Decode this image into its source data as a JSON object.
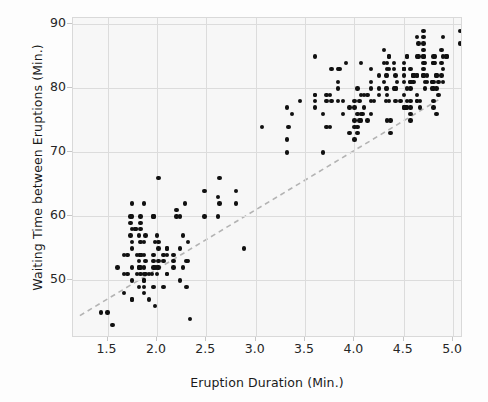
{
  "chart_data": {
    "type": "scatter",
    "title": "",
    "xlabel": "Eruption Duration (Min.)",
    "ylabel": "Waiting Time between Eruptions (Min.)",
    "xlim": [
      1.15,
      5.1
    ],
    "ylim": [
      41,
      91
    ],
    "xticks": [
      1.5,
      2.0,
      2.5,
      3.0,
      3.5,
      4.0,
      4.5,
      5.0
    ],
    "xticklabels": [
      "1.5",
      "2.0",
      "2.5",
      "3.0",
      "3.5",
      "4.0",
      "4.5",
      "5.0"
    ],
    "yticks": [
      50,
      60,
      70,
      80,
      90
    ],
    "yticklabels": [
      "50",
      "60",
      "70",
      "80",
      "90"
    ],
    "grid": true,
    "legend": "none",
    "marker_color": "#111111",
    "grid_color": "#dcdcdc",
    "plot_background": "#f7f7f7",
    "trendline": {
      "style": "dashed",
      "color": "#b3b3b3",
      "x0": 1.22,
      "y0": 44.5,
      "x1": 4.85,
      "y1": 78.2
    },
    "annotations": [],
    "points": [
      [
        3.6,
        79
      ],
      [
        1.8,
        54
      ],
      [
        3.333,
        74
      ],
      [
        2.283,
        62
      ],
      [
        4.533,
        85
      ],
      [
        2.883,
        55
      ],
      [
        4.7,
        88
      ],
      [
        3.6,
        85
      ],
      [
        1.95,
        51
      ],
      [
        4.35,
        85
      ],
      [
        1.833,
        54
      ],
      [
        3.917,
        84
      ],
      [
        4.2,
        78
      ],
      [
        1.75,
        47
      ],
      [
        4.7,
        83
      ],
      [
        2.167,
        52
      ],
      [
        1.75,
        62
      ],
      [
        4.8,
        84
      ],
      [
        1.6,
        52
      ],
      [
        4.25,
        79
      ],
      [
        1.8,
        51
      ],
      [
        1.75,
        47
      ],
      [
        3.45,
        78
      ],
      [
        3.067,
        74
      ],
      [
        4.533,
        85
      ],
      [
        3.6,
        77
      ],
      [
        1.967,
        60
      ],
      [
        4.083,
        76
      ],
      [
        3.85,
        83
      ],
      [
        4.433,
        81
      ],
      [
        4.3,
        81
      ],
      [
        4.467,
        78
      ],
      [
        3.367,
        76
      ],
      [
        4.033,
        74
      ],
      [
        3.833,
        81
      ],
      [
        2.017,
        66
      ],
      [
        1.867,
        62
      ],
      [
        4.833,
        76
      ],
      [
        1.833,
        58
      ],
      [
        4.783,
        81
      ],
      [
        4.35,
        78
      ],
      [
        1.883,
        57
      ],
      [
        4.567,
        76
      ],
      [
        1.75,
        60
      ],
      [
        4.533,
        78
      ],
      [
        3.317,
        77
      ],
      [
        3.833,
        78
      ],
      [
        2.1,
        55
      ],
      [
        4.633,
        78
      ],
      [
        2.0,
        57
      ],
      [
        4.8,
        80
      ],
      [
        4.716,
        80
      ],
      [
        1.833,
        59
      ],
      [
        4.833,
        82
      ],
      [
        1.733,
        59
      ],
      [
        4.883,
        84
      ],
      [
        3.717,
        79
      ],
      [
        1.667,
        51
      ],
      [
        4.567,
        75
      ],
      [
        4.317,
        80
      ],
      [
        2.233,
        60
      ],
      [
        4.5,
        81
      ],
      [
        1.75,
        52
      ],
      [
        4.8,
        84
      ],
      [
        1.817,
        49
      ],
      [
        4.4,
        84
      ],
      [
        4.167,
        80
      ],
      [
        4.7,
        87
      ],
      [
        2.067,
        49
      ],
      [
        4.7,
        85
      ],
      [
        4.033,
        73
      ],
      [
        1.967,
        54
      ],
      [
        4.5,
        83
      ],
      [
        4.0,
        78
      ],
      [
        1.983,
        52
      ],
      [
        5.067,
        87
      ],
      [
        2.017,
        56
      ],
      [
        4.567,
        80
      ],
      [
        3.883,
        78
      ],
      [
        3.6,
        78
      ],
      [
        4.133,
        79
      ],
      [
        4.333,
        75
      ],
      [
        4.1,
        77
      ],
      [
        2.633,
        66
      ],
      [
        4.067,
        84
      ],
      [
        4.933,
        85
      ],
      [
        3.95,
        73
      ],
      [
        4.517,
        77
      ],
      [
        2.167,
        54
      ],
      [
        4.0,
        74
      ],
      [
        2.2,
        60
      ],
      [
        4.333,
        84
      ],
      [
        1.867,
        48
      ],
      [
        4.817,
        84
      ],
      [
        1.833,
        51
      ],
      [
        4.3,
        86
      ],
      [
        4.667,
        78
      ],
      [
        3.75,
        79
      ],
      [
        1.867,
        51
      ],
      [
        4.9,
        88
      ],
      [
        2.483,
        64
      ],
      [
        4.367,
        75
      ],
      [
        2.1,
        51
      ],
      [
        4.5,
        83
      ],
      [
        4.05,
        78
      ],
      [
        1.867,
        56
      ],
      [
        4.7,
        82
      ],
      [
        1.783,
        58
      ],
      [
        4.85,
        81
      ],
      [
        3.683,
        76
      ],
      [
        4.733,
        82
      ],
      [
        2.3,
        49
      ],
      [
        4.9,
        81
      ],
      [
        4.417,
        82
      ],
      [
        1.7,
        54
      ],
      [
        4.633,
        82
      ],
      [
        2.317,
        53
      ],
      [
        4.6,
        82
      ],
      [
        1.817,
        57
      ],
      [
        4.417,
        80
      ],
      [
        2.617,
        63
      ],
      [
        4.067,
        75
      ],
      [
        4.25,
        80
      ],
      [
        1.967,
        60
      ],
      [
        4.6,
        81
      ],
      [
        3.767,
        83
      ],
      [
        1.917,
        51
      ],
      [
        4.5,
        77
      ],
      [
        2.267,
        57
      ],
      [
        4.65,
        87
      ],
      [
        1.867,
        54
      ],
      [
        4.167,
        81
      ],
      [
        2.8,
        62
      ],
      [
        4.333,
        79
      ],
      [
        2.017,
        52
      ],
      [
        4.633,
        88
      ],
      [
        1.833,
        60
      ],
      [
        4.783,
        80
      ],
      [
        4.35,
        85
      ],
      [
        1.883,
        51
      ],
      [
        4.567,
        78
      ],
      [
        1.75,
        58
      ],
      [
        4.533,
        77
      ],
      [
        3.317,
        70
      ],
      [
        3.833,
        80
      ],
      [
        2.1,
        54
      ],
      [
        4.633,
        78
      ],
      [
        2.0,
        51
      ],
      [
        4.8,
        77
      ],
      [
        4.716,
        81
      ],
      [
        1.833,
        56
      ],
      [
        4.833,
        80
      ],
      [
        1.733,
        60
      ],
      [
        4.883,
        82
      ],
      [
        3.717,
        78
      ],
      [
        1.667,
        54
      ],
      [
        4.567,
        77
      ],
      [
        4.317,
        78
      ],
      [
        2.233,
        50
      ],
      [
        4.5,
        83
      ],
      [
        1.75,
        56
      ],
      [
        4.8,
        81
      ],
      [
        1.817,
        52
      ],
      [
        4.4,
        83
      ],
      [
        4.167,
        78
      ],
      [
        4.7,
        86
      ],
      [
        2.067,
        53
      ],
      [
        4.7,
        85
      ],
      [
        4.033,
        76
      ],
      [
        1.967,
        53
      ],
      [
        4.5,
        84
      ],
      [
        4.0,
        75
      ],
      [
        1.983,
        56
      ],
      [
        5.067,
        89
      ],
      [
        2.017,
        53
      ],
      [
        4.567,
        81
      ],
      [
        3.883,
        76
      ],
      [
        3.6,
        79
      ],
      [
        4.133,
        75
      ],
      [
        4.333,
        80
      ],
      [
        4.1,
        79
      ],
      [
        2.633,
        62
      ],
      [
        4.067,
        79
      ],
      [
        4.933,
        85
      ],
      [
        3.95,
        77
      ],
      [
        4.517,
        77
      ],
      [
        2.167,
        53
      ],
      [
        4.0,
        77
      ],
      [
        2.2,
        61
      ],
      [
        4.333,
        83
      ],
      [
        1.867,
        50
      ],
      [
        4.817,
        85
      ],
      [
        1.833,
        52
      ],
      [
        4.3,
        84
      ],
      [
        4.667,
        77
      ],
      [
        3.75,
        74
      ],
      [
        1.867,
        49
      ],
      [
        4.9,
        85
      ],
      [
        2.483,
        60
      ],
      [
        4.367,
        73
      ],
      [
        2.1,
        55
      ],
      [
        4.5,
        83
      ],
      [
        4.05,
        75
      ],
      [
        1.867,
        52
      ],
      [
        4.7,
        84
      ],
      [
        1.783,
        58
      ],
      [
        4.85,
        79
      ],
      [
        3.683,
        70
      ],
      [
        4.733,
        81
      ],
      [
        2.3,
        53
      ],
      [
        4.9,
        83
      ],
      [
        4.417,
        80
      ],
      [
        1.7,
        51
      ],
      [
        4.633,
        82
      ],
      [
        2.317,
        56
      ],
      [
        4.6,
        82
      ],
      [
        1.817,
        52
      ],
      [
        4.417,
        78
      ],
      [
        2.617,
        60
      ],
      [
        4.067,
        76
      ],
      [
        4.25,
        82
      ],
      [
        1.967,
        52
      ],
      [
        4.6,
        82
      ],
      [
        3.767,
        78
      ],
      [
        1.917,
        47
      ],
      [
        4.5,
        82
      ],
      [
        2.267,
        52
      ],
      [
        4.65,
        85
      ],
      [
        1.867,
        50
      ],
      [
        4.167,
        83
      ],
      [
        2.8,
        64
      ],
      [
        4.333,
        82
      ],
      [
        2.017,
        55
      ],
      [
        4.633,
        85
      ],
      [
        1.833,
        54
      ],
      [
        4.783,
        81
      ],
      [
        4.35,
        83
      ],
      [
        1.883,
        53
      ],
      [
        4.567,
        81
      ],
      [
        1.75,
        55
      ],
      [
        4.533,
        80
      ],
      [
        3.317,
        72
      ],
      [
        3.833,
        83
      ],
      [
        2.1,
        51
      ],
      [
        4.633,
        79
      ],
      [
        2.0,
        52
      ],
      [
        4.8,
        78
      ],
      [
        4.716,
        84
      ],
      [
        1.833,
        54
      ],
      [
        4.833,
        82
      ],
      [
        1.733,
        57
      ],
      [
        4.883,
        86
      ],
      [
        3.717,
        74
      ],
      [
        1.667,
        48
      ],
      [
        4.567,
        83
      ],
      [
        4.317,
        82
      ],
      [
        2.233,
        55
      ],
      [
        4.5,
        77
      ],
      [
        1.75,
        50
      ],
      [
        4.8,
        85
      ],
      [
        1.817,
        53
      ],
      [
        4.4,
        80
      ],
      [
        4.167,
        76
      ],
      [
        4.7,
        89
      ],
      [
        2.067,
        54
      ],
      [
        4.7,
        82
      ],
      [
        4.033,
        80
      ],
      [
        1.967,
        49
      ],
      [
        4.5,
        79
      ],
      [
        4.0,
        72
      ],
      [
        1.983,
        46
      ],
      [
        2.333,
        44
      ],
      [
        1.55,
        43
      ],
      [
        1.5,
        45
      ],
      [
        1.433,
        45
      ]
    ]
  }
}
